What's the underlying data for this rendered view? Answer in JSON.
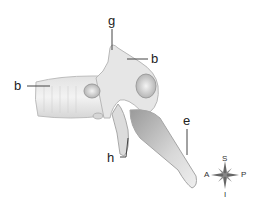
{
  "diagram": {
    "labels": [
      {
        "id": "g",
        "text": "g",
        "target": "superior articular process tip"
      },
      {
        "id": "b_upper",
        "text": "b",
        "target": "superior articular process"
      },
      {
        "id": "b_left",
        "text": "b",
        "target": "vertebral body"
      },
      {
        "id": "e",
        "text": "e",
        "target": "spinous process"
      },
      {
        "id": "h",
        "text": "h",
        "target": "inferior articular process"
      }
    ],
    "compass": {
      "top": "S",
      "bottom": "I",
      "left": "A",
      "right": "P"
    }
  }
}
